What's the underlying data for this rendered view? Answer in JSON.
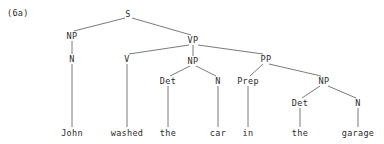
{
  "figure": {
    "example_label": "(6a)",
    "sentence": "John washed the car in the garage",
    "line_color": "#6b6b6b",
    "text_color": "#2b2b2b",
    "background_color": "#ffffff"
  },
  "nodes": {
    "s": {
      "label": "S",
      "x": 128,
      "y": 14
    },
    "subject_np": {
      "label": "NP",
      "x": 72,
      "y": 36
    },
    "subject_n": {
      "label": "N",
      "x": 72,
      "y": 59
    },
    "vp": {
      "label": "VP",
      "x": 193,
      "y": 40
    },
    "v": {
      "label": "V",
      "x": 127,
      "y": 59
    },
    "object_np": {
      "label": "NP",
      "x": 193,
      "y": 61
    },
    "object_det": {
      "label": "Det",
      "x": 168,
      "y": 81
    },
    "object_n": {
      "label": "N",
      "x": 218,
      "y": 81
    },
    "pp": {
      "label": "PP",
      "x": 266,
      "y": 59
    },
    "prep": {
      "label": "Prep",
      "x": 248,
      "y": 81
    },
    "pp_np": {
      "label": "NP",
      "x": 324,
      "y": 81
    },
    "pp_det": {
      "label": "Det",
      "x": 300,
      "y": 103
    },
    "pp_n": {
      "label": "N",
      "x": 358,
      "y": 103
    }
  },
  "leaves": [
    {
      "label": "John",
      "x": 72,
      "y": 133
    },
    {
      "label": "washed",
      "x": 127,
      "y": 133
    },
    {
      "label": "the",
      "x": 168,
      "y": 133
    },
    {
      "label": "car",
      "x": 218,
      "y": 133
    },
    {
      "label": "in",
      "x": 248,
      "y": 133
    },
    {
      "label": "the",
      "x": 300,
      "y": 133
    },
    {
      "label": "garage",
      "x": 358,
      "y": 133
    }
  ]
}
